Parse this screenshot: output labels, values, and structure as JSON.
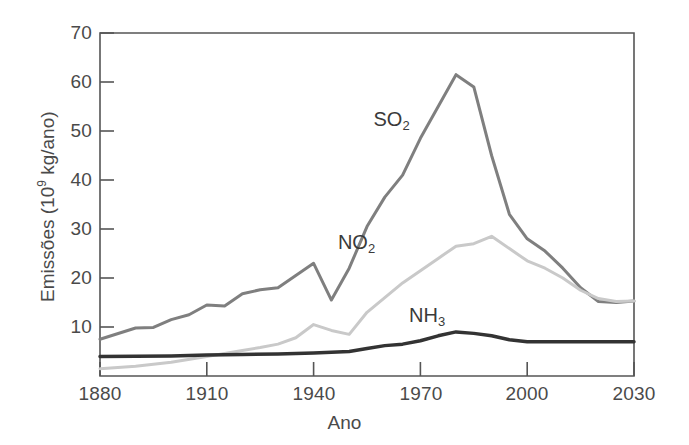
{
  "chart_data": {
    "type": "line",
    "title": "",
    "xlabel": "Ano",
    "ylabel": "Emissões (10⁹ kg/ano)",
    "ylabel_parts": {
      "prefix": "Emissões (10",
      "exponent": "9",
      "suffix": " kg/ano)"
    },
    "xlim": [
      1880,
      2030
    ],
    "ylim": [
      0,
      70
    ],
    "xticks": [
      1880,
      1910,
      1940,
      1970,
      2000,
      2030
    ],
    "yticks": [
      10,
      20,
      30,
      40,
      50,
      60,
      70
    ],
    "xtick_labels": [
      "1880",
      "1910",
      "1940",
      "1970",
      "2000",
      "2030"
    ],
    "ytick_labels": [
      "10",
      "20",
      "30",
      "40",
      "50",
      "60",
      "70"
    ],
    "grid": false,
    "legend_position": "inline-annotations",
    "colors": {
      "SO2": "#7f7f7f",
      "NO2": "#c9c9c9",
      "NH3": "#333333",
      "axis": "#555555"
    },
    "series": [
      {
        "name": "SO2",
        "label_text": "SO",
        "label_sub": "2",
        "color": "#7f7f7f",
        "line_width": 3,
        "label_x": 1963,
        "label_y": 52,
        "x": [
          1880,
          1890,
          1895,
          1900,
          1905,
          1910,
          1915,
          1920,
          1925,
          1930,
          1935,
          1940,
          1945,
          1950,
          1955,
          1960,
          1965,
          1970,
          1975,
          1980,
          1985,
          1990,
          1995,
          2000,
          2005,
          2010,
          2015,
          2020,
          2025,
          2030
        ],
        "y": [
          7.5,
          9.8,
          9.9,
          11.5,
          12.5,
          14.5,
          14.3,
          16.8,
          17.6,
          18.0,
          20.5,
          23.0,
          15.5,
          22.0,
          30.5,
          36.5,
          41.0,
          48.5,
          55.0,
          61.5,
          59.0,
          45.0,
          33.0,
          28.0,
          25.5,
          22.0,
          18.0,
          15.2,
          15.0,
          15.3
        ]
      },
      {
        "name": "NO2",
        "label_text": "NO",
        "label_sub": "2",
        "color": "#c9c9c9",
        "line_width": 3,
        "label_x": 1953,
        "label_y": 27,
        "x": [
          1880,
          1890,
          1900,
          1910,
          1920,
          1925,
          1930,
          1935,
          1940,
          1945,
          1950,
          1955,
          1960,
          1965,
          1970,
          1975,
          1980,
          1985,
          1990,
          1995,
          2000,
          2005,
          2010,
          2015,
          2020,
          2025,
          2030
        ],
        "y": [
          1.5,
          2.0,
          2.8,
          4.0,
          5.2,
          5.8,
          6.5,
          7.8,
          10.5,
          9.3,
          8.5,
          13.0,
          16.0,
          19.0,
          21.5,
          24.0,
          26.5,
          27.0,
          28.5,
          26.0,
          23.5,
          22.0,
          20.0,
          17.5,
          15.8,
          15.2,
          15.3
        ]
      },
      {
        "name": "NH3",
        "label_text": "NH",
        "label_sub": "3",
        "color": "#333333",
        "line_width": 3.5,
        "label_x": 1973,
        "label_y": 12,
        "x": [
          1880,
          1900,
          1910,
          1920,
          1930,
          1940,
          1950,
          1955,
          1960,
          1965,
          1970,
          1975,
          1980,
          1985,
          1990,
          1995,
          2000,
          2010,
          2020,
          2030
        ],
        "y": [
          4.0,
          4.1,
          4.3,
          4.4,
          4.5,
          4.7,
          5.0,
          5.6,
          6.2,
          6.5,
          7.2,
          8.2,
          9.0,
          8.7,
          8.2,
          7.4,
          7.0,
          7.0,
          7.0,
          7.0
        ]
      }
    ]
  },
  "axes": {
    "plot_left": 100,
    "plot_right": 634,
    "plot_top": 33,
    "plot_bottom": 376
  }
}
